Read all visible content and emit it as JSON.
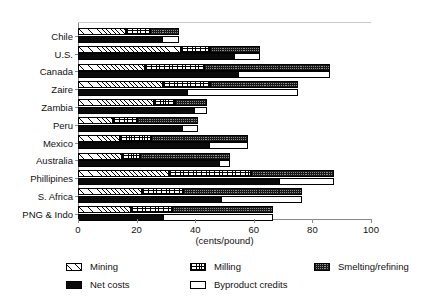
{
  "chart_data": {
    "type": "bar",
    "orientation": "horizontal",
    "title": "",
    "xlabel": "(cents/pound)",
    "ylabel": "",
    "xlim": [
      0,
      100
    ],
    "xticks": [
      0,
      20,
      40,
      60,
      80,
      100
    ],
    "xtick_labels": [
      "0",
      "20",
      "40",
      "60",
      "80",
      "100"
    ],
    "grid": false,
    "legend_position": "bottom",
    "categories": [
      "Chile",
      "U.S.",
      "Canada",
      "Zaire",
      "Zambia",
      "Peru",
      "Mexico",
      "Australia",
      "Phillipines",
      "S. Africa",
      "PNG & Indo"
    ],
    "legend_entries": [
      "Mining",
      "Milling",
      "Smelting/refining",
      "Net costs",
      "Byproduct credits"
    ],
    "series": [
      {
        "name": "Mining",
        "stack": "gross",
        "values": [
          16.5,
          35.0,
          23.0,
          29.0,
          26.0,
          12.0,
          14.5,
          15.0,
          31.0,
          22.0,
          18.0
        ]
      },
      {
        "name": "Milling",
        "stack": "gross",
        "values": [
          8.0,
          10.0,
          20.0,
          16.0,
          7.0,
          8.0,
          10.5,
          6.0,
          28.0,
          14.0,
          14.0
        ]
      },
      {
        "name": "Smelting/refining",
        "stack": "gross",
        "values": [
          10.0,
          17.0,
          43.0,
          30.0,
          11.0,
          21.0,
          33.0,
          31.0,
          28.5,
          40.5,
          34.5
        ]
      },
      {
        "name": "Net costs",
        "stack": "net",
        "values": [
          29.0,
          53.5,
          55.0,
          37.5,
          40.0,
          36.0,
          45.0,
          48.5,
          69.0,
          49.0,
          29.5
        ]
      },
      {
        "name": "Byproduct credits",
        "stack": "net",
        "values": [
          5.5,
          8.5,
          31.0,
          37.5,
          4.0,
          5.0,
          13.0,
          3.5,
          18.5,
          27.5,
          37.0
        ]
      }
    ],
    "totals": [
      34.5,
      62.0,
      86.0,
      75.0,
      44.0,
      41.0,
      58.0,
      52.0,
      87.5,
      76.5,
      66.5
    ]
  }
}
